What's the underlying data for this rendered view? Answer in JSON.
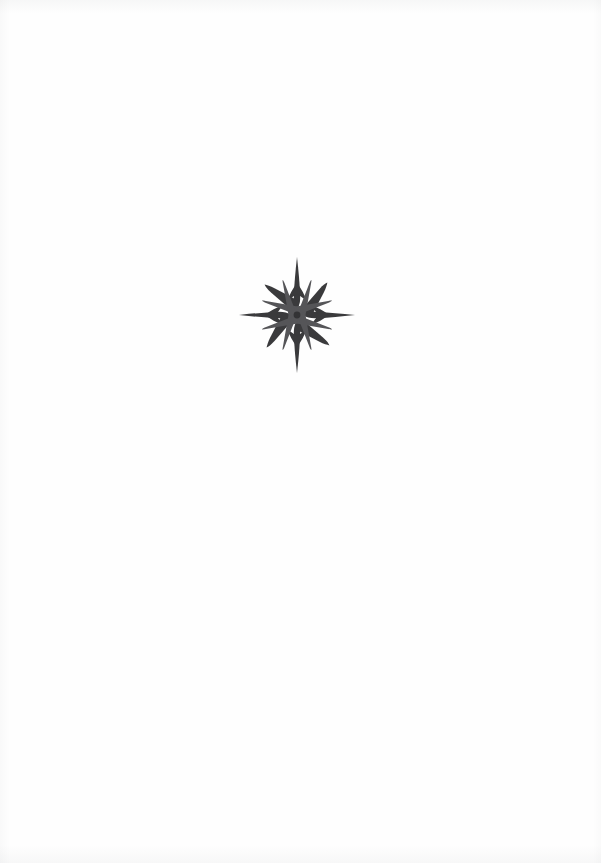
{
  "page": {
    "kind": "scanned-book-page",
    "width": 601,
    "height": 863,
    "background_color": "#fefefe",
    "paper_tone": "#ffffff",
    "visible_text": "",
    "header_text": "",
    "footer_text": "",
    "page_number": "",
    "body_text": ""
  },
  "ornament": {
    "name": "star-ornament",
    "description": "compass-rose star printer's ornament",
    "ink_color": "#3a3a3c",
    "ink_color_light": "#555558",
    "center_x": 297,
    "center_y": 302,
    "bbox": {
      "left": 248,
      "top": 248,
      "right": 348,
      "bottom": 358
    },
    "width": 100,
    "height": 110,
    "point_count": 4,
    "ray_count": 16,
    "label": "",
    "alt_text": "Decorative star ornament"
  }
}
